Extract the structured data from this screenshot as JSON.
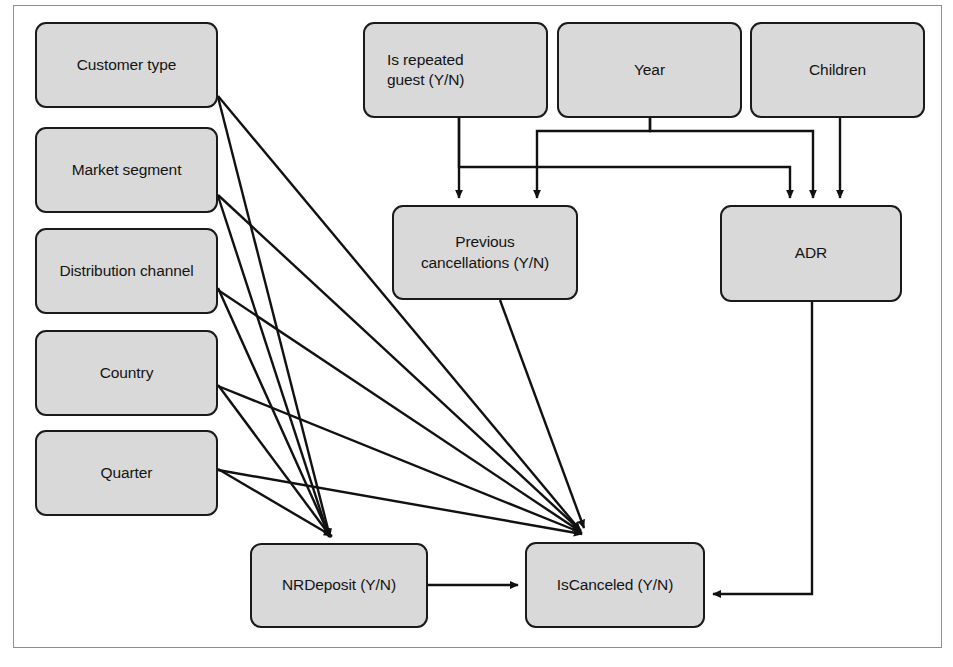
{
  "diagram": {
    "frame": {
      "border_color": "#8d8d8d"
    },
    "style": {
      "node_fill": "#d9d9d9",
      "node_border": "#1a1a1a",
      "edge_color": "#111111",
      "text_color": "#141414"
    },
    "nodes": [
      {
        "id": "customer-type",
        "label": "Customer type",
        "x": 35,
        "y": 22,
        "w": 183,
        "h": 86,
        "align": "center"
      },
      {
        "id": "market-segment",
        "label": "Market segment",
        "x": 35,
        "y": 127,
        "w": 183,
        "h": 86,
        "align": "center"
      },
      {
        "id": "distribution-channel",
        "label": "Distribution channel",
        "x": 35,
        "y": 228,
        "w": 183,
        "h": 86,
        "align": "center"
      },
      {
        "id": "country",
        "label": "Country",
        "x": 35,
        "y": 330,
        "w": 183,
        "h": 86,
        "align": "center"
      },
      {
        "id": "quarter",
        "label": "Quarter",
        "x": 35,
        "y": 430,
        "w": 183,
        "h": 86,
        "align": "center"
      },
      {
        "id": "is-repeated-guest",
        "label": "Is repeated\nguest (Y/N)",
        "x": 363,
        "y": 22,
        "w": 185,
        "h": 96,
        "align": "left"
      },
      {
        "id": "year",
        "label": "Year",
        "x": 557,
        "y": 22,
        "w": 185,
        "h": 96,
        "align": "center"
      },
      {
        "id": "children",
        "label": "Children",
        "x": 750,
        "y": 22,
        "w": 175,
        "h": 96,
        "align": "center"
      },
      {
        "id": "previous-cancellations",
        "label": "Previous\ncancellations (Y/N)",
        "x": 392,
        "y": 205,
        "w": 186,
        "h": 95,
        "align": "center"
      },
      {
        "id": "adr",
        "label": "ADR",
        "x": 720,
        "y": 205,
        "w": 182,
        "h": 97,
        "align": "center"
      },
      {
        "id": "nr-deposit",
        "label": "NRDeposit (Y/N)",
        "x": 250,
        "y": 543,
        "w": 178,
        "h": 85,
        "align": "center"
      },
      {
        "id": "is-canceled",
        "label": "IsCanceled (Y/N)",
        "x": 525,
        "y": 542,
        "w": 180,
        "h": 86,
        "align": "center"
      }
    ],
    "edges": [
      {
        "from": "customer-type",
        "to": "nr-deposit",
        "kind": "diagonal"
      },
      {
        "from": "customer-type",
        "to": "is-canceled",
        "kind": "diagonal"
      },
      {
        "from": "market-segment",
        "to": "nr-deposit",
        "kind": "diagonal"
      },
      {
        "from": "market-segment",
        "to": "is-canceled",
        "kind": "diagonal"
      },
      {
        "from": "distribution-channel",
        "to": "nr-deposit",
        "kind": "diagonal"
      },
      {
        "from": "distribution-channel",
        "to": "is-canceled",
        "kind": "diagonal"
      },
      {
        "from": "country",
        "to": "nr-deposit",
        "kind": "diagonal"
      },
      {
        "from": "country",
        "to": "is-canceled",
        "kind": "diagonal"
      },
      {
        "from": "quarter",
        "to": "nr-deposit",
        "kind": "diagonal"
      },
      {
        "from": "quarter",
        "to": "is-canceled",
        "kind": "diagonal"
      },
      {
        "from": "is-repeated-guest",
        "to": "previous-cancellations",
        "kind": "orthogonal"
      },
      {
        "from": "is-repeated-guest",
        "to": "adr",
        "kind": "orthogonal"
      },
      {
        "from": "year",
        "to": "previous-cancellations",
        "kind": "orthogonal"
      },
      {
        "from": "year",
        "to": "adr",
        "kind": "orthogonal"
      },
      {
        "from": "children",
        "to": "adr",
        "kind": "orthogonal"
      },
      {
        "from": "previous-cancellations",
        "to": "is-canceled",
        "kind": "diagonal"
      },
      {
        "from": "nr-deposit",
        "to": "is-canceled",
        "kind": "orthogonal"
      },
      {
        "from": "adr",
        "to": "is-canceled",
        "kind": "orthogonal"
      }
    ]
  }
}
